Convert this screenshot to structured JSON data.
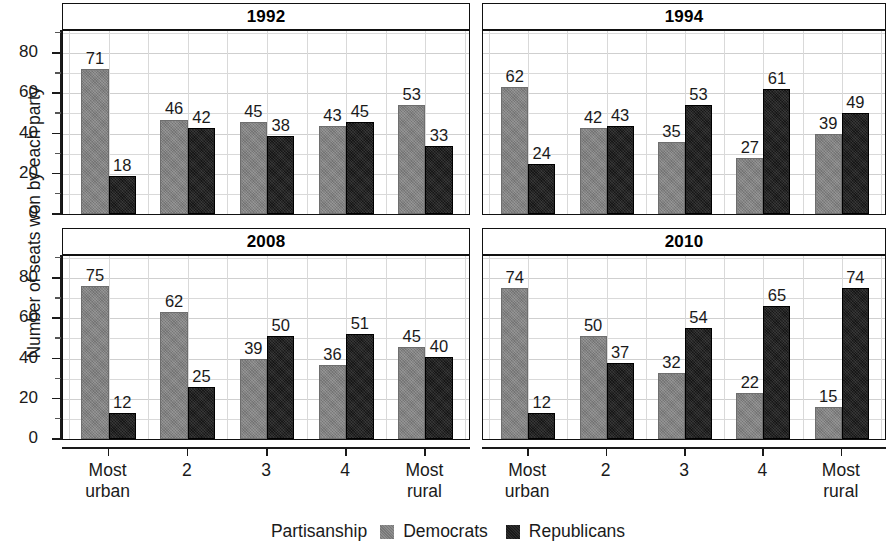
{
  "chart_data": {
    "type": "bar",
    "title": "",
    "xlabel": "",
    "ylabel": "Number of seats won by each party",
    "ylim": [
      0,
      90
    ],
    "yticks": [
      0,
      20,
      40,
      60,
      80
    ],
    "ytick_labels": [
      "0",
      "20",
      "40",
      "60",
      "80"
    ],
    "grid": true,
    "legend_position": "bottom",
    "legend_title": "Partisanship",
    "categories": [
      "Most urban",
      "2",
      "3",
      "4",
      "Most rural"
    ],
    "category_lines": [
      [
        "Most",
        "urban"
      ],
      [
        "2",
        ""
      ],
      [
        "3",
        ""
      ],
      [
        "4",
        ""
      ],
      [
        "Most",
        "rural"
      ]
    ],
    "series_names": [
      "Democrats",
      "Republicans"
    ],
    "series_colors": [
      "#7f7f7f",
      "#1b1b1b"
    ],
    "panels": [
      {
        "title": "1992",
        "series": [
          {
            "name": "Democrats",
            "values": [
              71,
              46,
              45,
              43,
              53
            ]
          },
          {
            "name": "Republicans",
            "values": [
              18,
              42,
              38,
              45,
              33
            ]
          }
        ]
      },
      {
        "title": "1994",
        "series": [
          {
            "name": "Democrats",
            "values": [
              62,
              42,
              35,
              27,
              39
            ]
          },
          {
            "name": "Republicans",
            "values": [
              24,
              43,
              53,
              61,
              49
            ]
          }
        ]
      },
      {
        "title": "2008",
        "series": [
          {
            "name": "Democrats",
            "values": [
              75,
              62,
              39,
              36,
              45
            ]
          },
          {
            "name": "Republicans",
            "values": [
              12,
              25,
              50,
              51,
              40
            ]
          }
        ]
      },
      {
        "title": "2010",
        "series": [
          {
            "name": "Democrats",
            "values": [
              74,
              50,
              32,
              22,
              15
            ]
          },
          {
            "name": "Republicans",
            "values": [
              12,
              37,
              54,
              65,
              74
            ]
          }
        ]
      }
    ]
  },
  "axis": {
    "y_label": "Number of seats won by each party",
    "y_tick_labels": [
      "80",
      "60",
      "40",
      "20",
      "0"
    ],
    "x_tick_labels": [
      "Most urban",
      "2",
      "3",
      "4",
      "Most rural"
    ]
  },
  "legend": {
    "title": "Partisanship",
    "entries": [
      {
        "label": "Democrats",
        "color": "#7f7f7f"
      },
      {
        "label": "Republicans",
        "color": "#1b1b1b"
      }
    ]
  },
  "panel_titles": [
    "1992",
    "1994",
    "2008",
    "2010"
  ]
}
